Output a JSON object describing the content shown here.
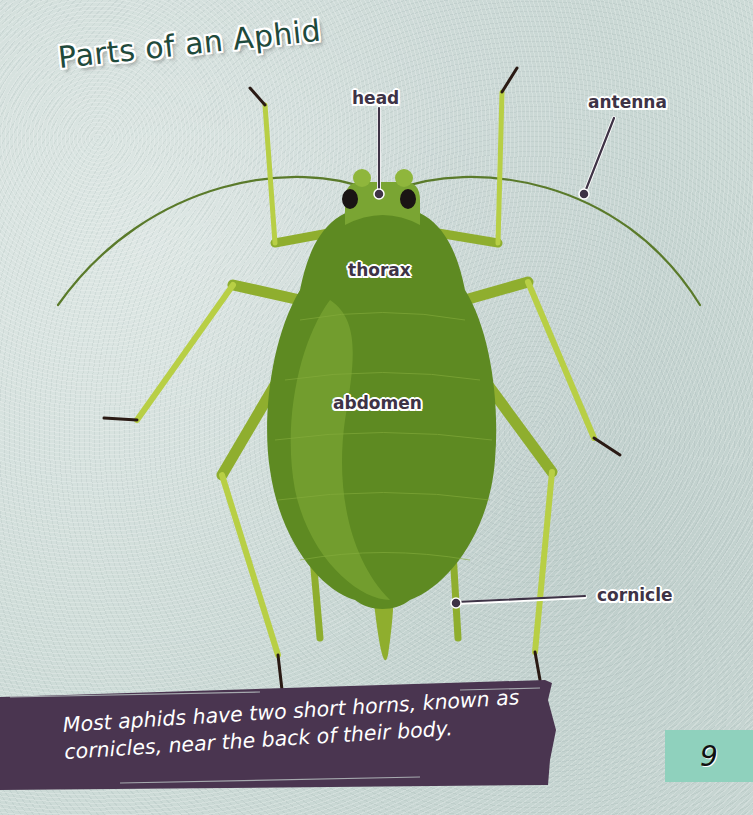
{
  "page": {
    "title": "Parts of an Aphid",
    "page_number": "9",
    "colors": {
      "background": "#cddbd7",
      "body_green": "#6f9a2b",
      "body_dark": "#5e8a22",
      "leg_green": "#a9c43a",
      "label_text": "#3e3346",
      "banner": "#4a3550",
      "page_tab": "#8fd1bd",
      "title_text": "#1f4a3c"
    }
  },
  "diagram": {
    "subject": "aphid",
    "labels": [
      {
        "id": "head",
        "text": "head",
        "pointer": true
      },
      {
        "id": "antenna",
        "text": "antenna",
        "pointer": true
      },
      {
        "id": "thorax",
        "text": "thorax",
        "pointer": false
      },
      {
        "id": "abdomen",
        "text": "abdomen",
        "pointer": false
      },
      {
        "id": "cornicle",
        "text": "cornicle",
        "pointer": true
      }
    ]
  },
  "caption": {
    "text": "Most aphids have two short horns, known as cornicles, near the back of their body."
  }
}
